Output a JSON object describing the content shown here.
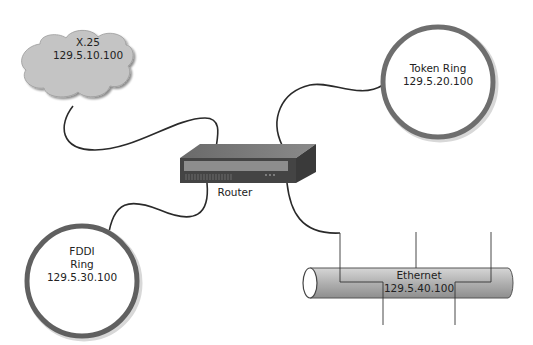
{
  "diagram": {
    "router": {
      "label": "Router"
    },
    "nodes": [
      {
        "id": "x25",
        "type": "cloud",
        "name": "X.25",
        "address": "129.5.10.100"
      },
      {
        "id": "token-ring",
        "type": "ring",
        "name": "Token Ring",
        "address": "129.5.20.100"
      },
      {
        "id": "fddi",
        "type": "ring",
        "name": "FDDI",
        "name2": "Ring",
        "address": "129.5.30.100"
      },
      {
        "id": "ethernet",
        "type": "bus",
        "name": "Ethernet",
        "address": "129.5.40.100"
      }
    ],
    "edges": [
      {
        "from": "router",
        "to": "x25"
      },
      {
        "from": "router",
        "to": "token-ring"
      },
      {
        "from": "router",
        "to": "fddi"
      },
      {
        "from": "router",
        "to": "ethernet"
      }
    ],
    "colors": {
      "cloud": "#c4c4c4",
      "ring": "#6e6e6e",
      "router": "#4a4a4a",
      "tube": "#b3b3b3",
      "cable": "#2a2a2a"
    }
  }
}
